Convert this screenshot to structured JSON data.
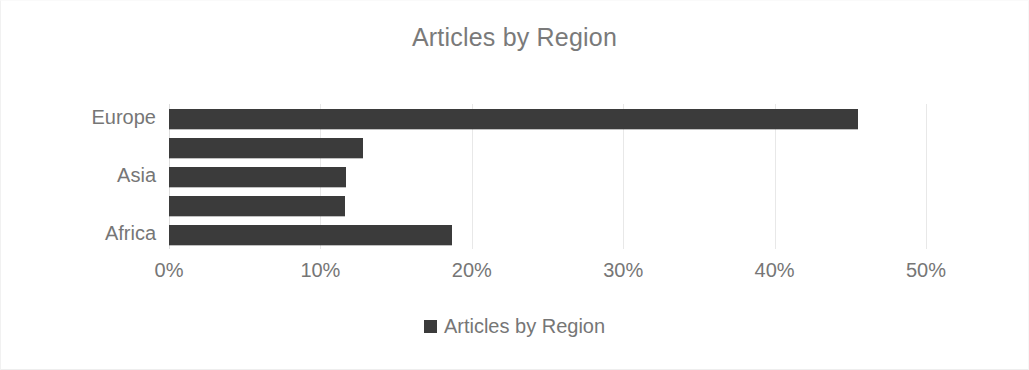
{
  "chart_data": {
    "type": "bar",
    "orientation": "horizontal",
    "title": "Articles by Region",
    "xlabel": "",
    "ylabel": "",
    "xlim": [
      0,
      50
    ],
    "grid": true,
    "grid_axis": "x",
    "legend_position": "bottom",
    "bar_color": "#3b3b3b",
    "text_color": "#767676",
    "title_color": "#7a7a7a",
    "gridline_color": "#e8e8e8",
    "background_color": "#ffffff",
    "categories": [
      "Europe",
      "",
      "Asia",
      "",
      "Africa"
    ],
    "visible_category_labels": [
      "Europe",
      "Asia",
      "Africa"
    ],
    "values": [
      45.5,
      12.8,
      11.7,
      11.6,
      18.7
    ],
    "value_unit": "%",
    "xticks": [
      0,
      10,
      20,
      30,
      40,
      50
    ],
    "xtick_labels": [
      "0%",
      "10%",
      "20%",
      "30%",
      "40%",
      "50%"
    ],
    "series": [
      {
        "name": "Articles by Region",
        "values": [
          45.5,
          12.8,
          11.7,
          11.6,
          18.7
        ]
      }
    ],
    "legend": [
      "Articles by Region"
    ]
  },
  "legend": {
    "swatch_name": "legend-color-swatch",
    "label": "Articles by Region"
  }
}
